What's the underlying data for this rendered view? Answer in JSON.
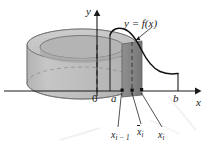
{
  "figure": {
    "type": "calculus-shell-method-diagram",
    "caption_none": "",
    "background_color": "#ffffff",
    "axes": {
      "x_label": "x",
      "y_label": "y",
      "origin_label": "0"
    },
    "curve": {
      "label": "y = f(x)",
      "stroke_color": "#111111"
    },
    "x_marks": {
      "a": "a",
      "b": "b",
      "x_prev": "x",
      "x_prev_sub": "i − 1",
      "x_mid": "x",
      "x_mid_sub": "i",
      "x_next": "x",
      "x_next_sub": "i"
    },
    "solid": {
      "name": "cylindrical-shell",
      "body_color": "#bdbdbd",
      "top_color": "#c9c9c9",
      "inner_hole_color": "#b0b0b0",
      "shell_strip_color": "#8a8a8a",
      "outline_color": "#6e6e6e"
    }
  }
}
